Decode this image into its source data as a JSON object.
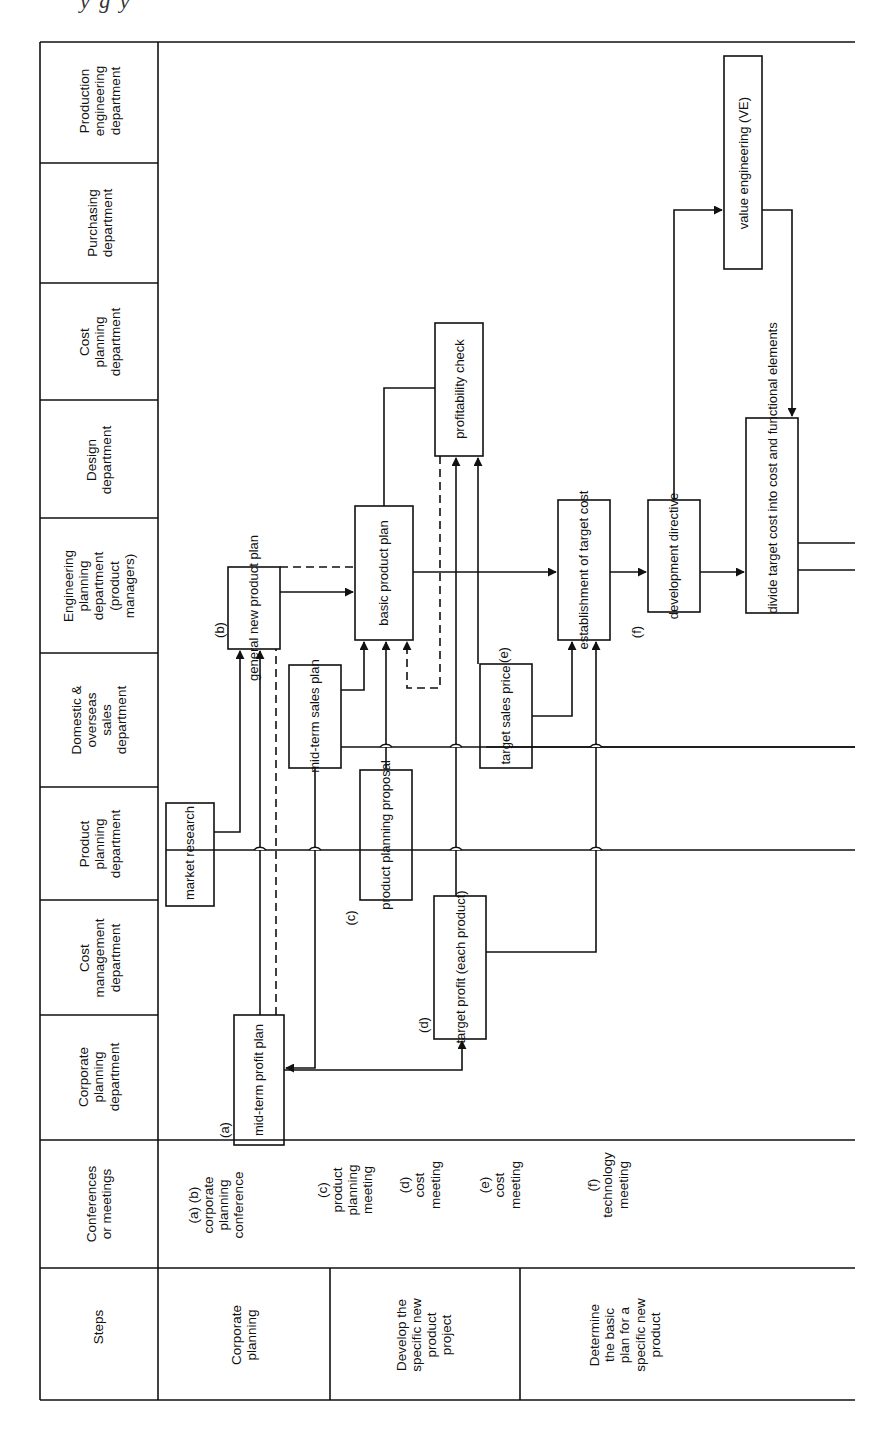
{
  "page": {
    "caption_fragment": "y g y"
  },
  "departments": [
    {
      "id": "production-engineering",
      "label": "Production\nengineering\ndepartment"
    },
    {
      "id": "purchasing",
      "label": "Purchasing\ndepartment"
    },
    {
      "id": "cost-planning",
      "label": "Cost\nplanning\ndepartment"
    },
    {
      "id": "design",
      "label": "Design\ndepartment"
    },
    {
      "id": "engineering-planning",
      "label": "Engineering\nplanning\ndepartment\n(product\nmanagers)"
    },
    {
      "id": "sales",
      "label": "Domestic &\noverseas\nsales\ndepartment"
    },
    {
      "id": "product-planning",
      "label": "Product\nplanning\ndepartment"
    },
    {
      "id": "cost-management",
      "label": "Cost\nmanagement\ndepartment"
    },
    {
      "id": "corporate-planning",
      "label": "Corporate\nplanning\ndepartment"
    }
  ],
  "row_headers": {
    "conferences": "Conferences\nor meetings",
    "steps": "Steps"
  },
  "conferences": [
    {
      "label": "(a)  (b)\ncorporate\nplanning\nconference"
    },
    {
      "label": "(c)\nproduct\nplanning\nmeeting"
    },
    {
      "label": "(d)\ncost\nmeeting"
    },
    {
      "label": "(e)\ncost\nmeeting"
    },
    {
      "label": "(f)\ntechnology\nmeeting"
    }
  ],
  "steps": [
    {
      "label": "Corporate\nplanning"
    },
    {
      "label": "Develop the\nspecific new\nproduct\nproject"
    },
    {
      "label": "Determine\nthe basic\nplan for a\nspecific new\nproduct"
    }
  ],
  "nodes": {
    "market_research": "market\nresearch",
    "mid_term_profit_plan": "mid-term\nprofit plan",
    "general_new_product_plan": "general new\nproduct plan",
    "mid_term_sales_plan": "mid-term\nsales plan",
    "product_planning_proposal": "product planning\nproposal",
    "basic_product_plan": "basic\nproduct plan",
    "profitability_check": "profitability\ncheck",
    "target_profit": "target profit\n(each product)",
    "target_sales_price": "target\nsales price",
    "establishment_of_target_cost": "establishment\nof target cost",
    "development_directive": "development\ndirective",
    "value_engineering": "value engineering (VE)",
    "divide_target_cost": "divide\ntarget cost into cost and\nfunctional elements"
  },
  "node_tags": {
    "a": "(a)",
    "b": "(b)",
    "c": "(c)",
    "d": "(d)",
    "e": "(e)",
    "f": "(f)"
  }
}
